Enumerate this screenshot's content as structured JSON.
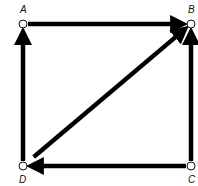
{
  "diagram": {
    "type": "directed-graph",
    "nodes": [
      {
        "id": "A",
        "label": "A",
        "x": 23,
        "y": 24,
        "lx": 20,
        "ly": 13
      },
      {
        "id": "B",
        "label": "B",
        "x": 191,
        "y": 24,
        "lx": 188,
        "ly": 13
      },
      {
        "id": "C",
        "label": "C",
        "x": 191,
        "y": 166,
        "lx": 188,
        "ly": 183
      },
      {
        "id": "D",
        "label": "D",
        "x": 23,
        "y": 166,
        "lx": 19,
        "ly": 183
      }
    ],
    "edges": [
      {
        "from": "A",
        "to": "B"
      },
      {
        "from": "D",
        "to": "A"
      },
      {
        "from": "C",
        "to": "B"
      },
      {
        "from": "C",
        "to": "D"
      },
      {
        "from": "D",
        "to": "B"
      }
    ],
    "colors": {
      "edge": "#000000",
      "node_fill": "#ffffff",
      "node_stroke": "#111111"
    }
  }
}
